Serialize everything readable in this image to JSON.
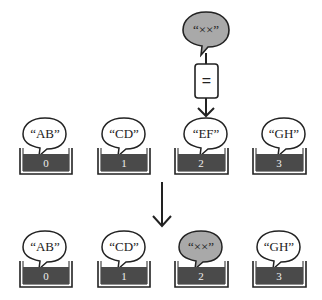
{
  "diagram": {
    "colors": {
      "stroke": "#222222",
      "cell_fill": "#4a4a4a",
      "highlight_bubble": "#a9a9a9",
      "bubble": "#ffffff",
      "index_text": "#eeeeee"
    },
    "new_value": {
      "label": "“××”",
      "highlighted": true
    },
    "operator": {
      "symbol": "="
    },
    "before": {
      "cells": [
        {
          "index": "0",
          "value": "“AB”",
          "highlighted": false
        },
        {
          "index": "1",
          "value": "“CD”",
          "highlighted": false
        },
        {
          "index": "2",
          "value": "“EF”",
          "highlighted": false
        },
        {
          "index": "3",
          "value": "“GH”",
          "highlighted": false
        }
      ]
    },
    "after": {
      "cells": [
        {
          "index": "0",
          "value": "“AB”",
          "highlighted": false
        },
        {
          "index": "1",
          "value": "“CD”",
          "highlighted": false
        },
        {
          "index": "2",
          "value": "“××”",
          "highlighted": true
        },
        {
          "index": "3",
          "value": "“GH”",
          "highlighted": false
        }
      ]
    }
  }
}
